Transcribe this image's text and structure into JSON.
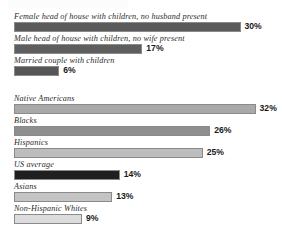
{
  "chart_data": {
    "type": "bar",
    "title": "",
    "subtitle": "",
    "xlabel": "",
    "ylabel": "",
    "orientation": "horizontal",
    "grid": false,
    "legend": "none",
    "value_suffix": "%",
    "xlim": [
      0,
      35
    ],
    "groups": [
      {
        "name": "household-type",
        "bars": [
          {
            "label": "Female head of house with children, no husband present",
            "value": 30,
            "value_label": "30%",
            "color": "#5a5a5a"
          },
          {
            "label": "Male head of house with children, no wife present",
            "value": 17,
            "value_label": "17%",
            "color": "#5e5e5e"
          },
          {
            "label": "Married couple with children",
            "value": 6,
            "value_label": "6%",
            "color": "#565656"
          }
        ]
      },
      {
        "name": "race-ethnicity",
        "bars": [
          {
            "label": "Native Americans",
            "value": 32,
            "value_label": "32%",
            "color": "#a9a9a9"
          },
          {
            "label": "Blacks",
            "value": 26,
            "value_label": "26%",
            "color": "#8f8f8f"
          },
          {
            "label": "Hispanics",
            "value": 25,
            "value_label": "25%",
            "color": "#bdbdbd"
          },
          {
            "label": "US average",
            "value": 14,
            "value_label": "14%",
            "color": "#1f1f1f"
          },
          {
            "label": "Asians",
            "value": 13,
            "value_label": "13%",
            "color": "#c4c4c4"
          },
          {
            "label": "Non-Hispanic Whites",
            "value": 9,
            "value_label": "9%",
            "color": "#dcdcdc"
          }
        ]
      }
    ]
  },
  "scale": {
    "bar_origin_px": 14,
    "px_per_percent": 7.55,
    "value_gap_px": 4
  }
}
